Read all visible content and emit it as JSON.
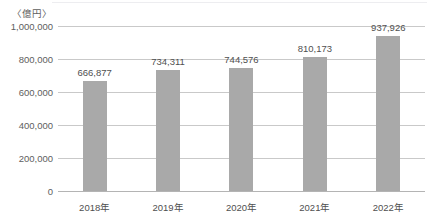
{
  "chart_data": {
    "type": "bar",
    "title": "",
    "subtitle": "",
    "unit_label": "〈億円〉",
    "xlabel": "",
    "ylabel": "",
    "categories": [
      "2018年",
      "2019年",
      "2020年",
      "2021年",
      "2022年"
    ],
    "values": [
      666877,
      734311,
      744576,
      810173,
      937926
    ],
    "value_labels": [
      "666,877",
      "734,311",
      "744,576",
      "810,173",
      "937,926"
    ],
    "ylim": [
      0,
      1000000
    ],
    "yticks": [
      1000000,
      800000,
      600000,
      400000,
      200000,
      0
    ],
    "ytick_labels": [
      "1,000,000",
      "800,000",
      "600,000",
      "400,000",
      "200,000",
      "0"
    ],
    "grid": true,
    "legend": false,
    "legend_position": "none",
    "series": [
      {
        "name": "",
        "values": [
          666877,
          734311,
          744576,
          810173,
          937926
        ]
      }
    ],
    "colors": {
      "bar": "#a9a9a9",
      "gridline": "#c9c9c9",
      "axis": "#b4b4b4",
      "text": "#4f4f4f",
      "background": "#ffffff"
    }
  }
}
